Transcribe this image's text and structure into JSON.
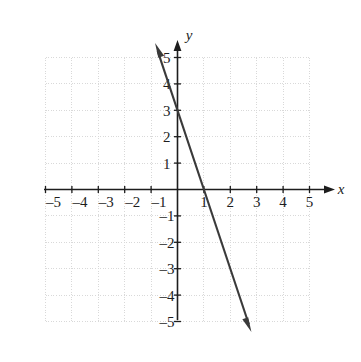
{
  "chart_data": {
    "type": "line",
    "title": "",
    "xlabel": "x",
    "ylabel": "y",
    "xlim": [
      -5,
      5
    ],
    "ylim": [
      -5,
      5
    ],
    "grid": true,
    "grid_style": "dotted",
    "grid_color": "#d9d9d9",
    "axis_color": "#1d1d1d",
    "line_color": "#3a3a3a",
    "legend": "none",
    "x_ticks": [
      -5,
      -4,
      -3,
      -2,
      -1,
      1,
      2,
      3,
      4,
      5
    ],
    "y_ticks": [
      5,
      4,
      3,
      2,
      1,
      -1,
      -2,
      -3,
      -4,
      -5
    ],
    "x_tick_labels": [
      "–5",
      "–4",
      "–3",
      "–2",
      "–1",
      "1",
      "2",
      "3",
      "4",
      "5"
    ],
    "y_tick_labels": [
      "5",
      "4",
      "3",
      "2",
      "1",
      "–1",
      "–2",
      "–3",
      "–4",
      "–5"
    ],
    "series": [
      {
        "name": "line",
        "equation": "y = -3x + 3",
        "slope": -3,
        "y_intercept": 3,
        "x_intercept": 1,
        "points": [
          [
            -0.85,
            5.55
          ],
          [
            2.8,
            -5.4
          ]
        ],
        "arrow_start": true,
        "arrow_end": true
      }
    ],
    "annotations": []
  },
  "axes": {
    "x_axis_label": "x",
    "y_axis_label": "y"
  }
}
